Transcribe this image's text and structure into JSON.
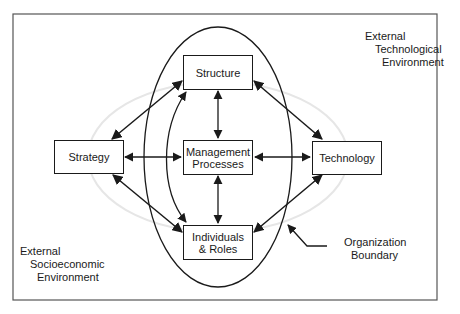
{
  "diagram": {
    "nodes": {
      "structure": "Structure",
      "management_line1": "Management",
      "management_line2": "Processes",
      "individuals_line1": "Individuals",
      "individuals_line2": "& Roles",
      "strategy": "Strategy",
      "technology": "Technology"
    },
    "labels": {
      "tech_env_line1": "External",
      "tech_env_line2": "Technological",
      "tech_env_line3": "Environment",
      "socio_env_line1": "External",
      "socio_env_line2": "Socioeconomic",
      "socio_env_line3": "Environment",
      "boundary_line1": "Organization",
      "boundary_line2": "Boundary"
    },
    "edges": [
      {
        "from": "Structure",
        "to": "Management Processes",
        "type": "bidirectional"
      },
      {
        "from": "Management Processes",
        "to": "Individuals & Roles",
        "type": "bidirectional"
      },
      {
        "from": "Strategy",
        "to": "Management Processes",
        "type": "bidirectional"
      },
      {
        "from": "Management Processes",
        "to": "Technology",
        "type": "bidirectional"
      },
      {
        "from": "Strategy",
        "to": "Structure",
        "type": "bidirectional"
      },
      {
        "from": "Strategy",
        "to": "Individuals & Roles",
        "type": "bidirectional"
      },
      {
        "from": "Technology",
        "to": "Structure",
        "type": "bidirectional"
      },
      {
        "from": "Technology",
        "to": "Individuals & Roles",
        "type": "bidirectional"
      },
      {
        "from": "Structure",
        "to": "Individuals & Roles",
        "type": "bidirectional-curved"
      }
    ],
    "colors": {
      "line": "#1a1a1a",
      "faint_ellipse": "#e6e6e6"
    }
  }
}
